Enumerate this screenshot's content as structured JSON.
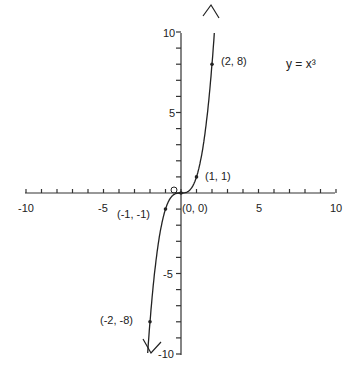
{
  "chart_data": {
    "type": "line",
    "title": "y = x³",
    "xlabel": "",
    "ylabel": "",
    "xlim": [
      -10,
      10
    ],
    "ylim": [
      -10,
      10
    ],
    "grid": false,
    "x_ticks": [
      -10,
      -5,
      0,
      5,
      10
    ],
    "y_ticks": [
      -10,
      -5,
      5,
      10
    ],
    "x_tick_labels": [
      "-10",
      "-5",
      "5",
      "10"
    ],
    "y_tick_labels": [
      "10",
      "5",
      "-5",
      "-10"
    ],
    "series": [
      {
        "name": "y = x³",
        "function": "x^3",
        "x_range": [
          -2.15,
          2.15
        ],
        "arrows_at_ends": true
      }
    ],
    "labeled_points": [
      {
        "x": 2,
        "y": 8,
        "label": "(2, 8)"
      },
      {
        "x": 1,
        "y": 1,
        "label": "(1, 1)"
      },
      {
        "x": 0,
        "y": 0,
        "label": "(0, 0)"
      },
      {
        "x": -1,
        "y": -1,
        "label": "(-1, -1)"
      },
      {
        "x": -2,
        "y": -8,
        "label": "(-2, -8)"
      }
    ],
    "annotations": [
      "y = x³"
    ]
  },
  "labels": {
    "equation": "y = x³",
    "x_neg10": "-10",
    "x_neg5": "-5",
    "x_5": "5",
    "x_10": "10",
    "y_10": "10",
    "y_5": "5",
    "y_neg5": "-5",
    "y_neg10": "-10",
    "p_2_8": "(2, 8)",
    "p_1_1": "(1, 1)",
    "p_0_0": "(0, 0)",
    "p_m1_m1": "(-1, -1)",
    "p_m2_m8": "(-2, -8)"
  }
}
